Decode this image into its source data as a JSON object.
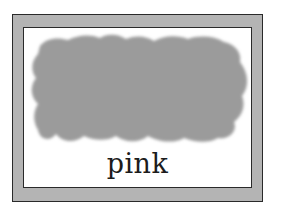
{
  "card": {
    "label": "pink",
    "swatch_color": "#9a9a9a",
    "frame_color": "#b4b4b4",
    "border_color": "#2a2a2a"
  }
}
